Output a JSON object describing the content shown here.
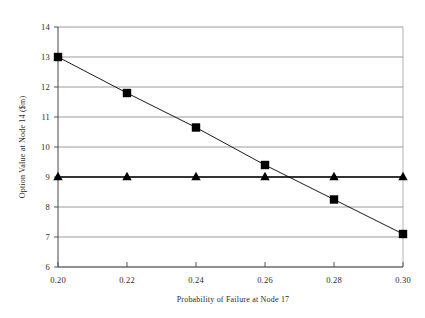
{
  "chart_data": {
    "type": "line",
    "title": "",
    "subtitle": "",
    "xlabel": "Probability of Failure at Node 17",
    "ylabel": "Option Value at Node 14 ($m)",
    "x": [
      0.2,
      0.22,
      0.24,
      0.26,
      0.28,
      0.3
    ],
    "xlim": [
      0.2,
      0.3
    ],
    "ylim": [
      6,
      14
    ],
    "xticks": [
      0.2,
      0.22,
      0.24,
      0.26,
      0.28,
      0.3
    ],
    "yticks": [
      6,
      7,
      8,
      9,
      10,
      11,
      12,
      13,
      14
    ],
    "xtick_labels": [
      "0.20",
      "0.22",
      "0.24",
      "0.26",
      "0.28",
      "0.30"
    ],
    "ytick_labels": [
      "6",
      "7",
      "8",
      "9",
      "10",
      "11",
      "12",
      "13",
      "14"
    ],
    "grid": "horizontal",
    "legend": "none",
    "series": [
      {
        "name": "series-square",
        "marker": "square",
        "color": "#000000",
        "values": [
          13.0,
          11.8,
          10.65,
          9.4,
          8.25,
          7.1
        ]
      },
      {
        "name": "series-triangle",
        "marker": "triangle",
        "color": "#000000",
        "values": [
          9.0,
          9.0,
          9.0,
          9.0,
          9.0,
          9.0
        ]
      }
    ]
  },
  "axes": {
    "y_axis_title": "Option Value at Node 14 ($m)",
    "x_axis_title": "Probability of Failure at Node 17"
  },
  "style": {
    "background": "#ffffff",
    "grid_color": "#8f8f8f",
    "axis_color": "#555555",
    "series_color": "#000000"
  }
}
